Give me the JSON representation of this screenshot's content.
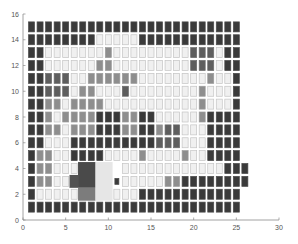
{
  "chart_data": {
    "type": "heatmap",
    "title": "",
    "xlabel": "",
    "ylabel": "",
    "xlim": [
      0,
      30
    ],
    "ylim": [
      0,
      16
    ],
    "xticks": [
      0,
      5,
      10,
      15,
      20,
      25,
      30
    ],
    "yticks": [
      0,
      2,
      4,
      6,
      8,
      10,
      12,
      14,
      16
    ],
    "grid": false,
    "legend": null,
    "n_cols": 25,
    "n_rows": 15,
    "cell_levels_legend": {
      "0": "light",
      "1": "medium gray",
      "2": "medium-dark",
      "3": "dark",
      "s": "small dark",
      "-": "merged region (no individual cell)"
    },
    "rows_top_to_bottom": [
      {
        "y": 15,
        "cells": "3333333333333333333333333"
      },
      {
        "y": 14,
        "cells": "3333333300000333333333333"
      },
      {
        "y": 13,
        "cells": "3300000001000000000222033"
      },
      {
        "y": 12,
        "cells": "3300000011000000000222033"
      },
      {
        "y": 11,
        "cells": "3322200111111000000001003"
      },
      {
        "y": 10,
        "cells": "3322201100020000000010003"
      },
      {
        "y": 9,
        "cells": "3311011110000000000010003"
      },
      {
        "y": 8,
        "cells": "3310111133311330000013333"
      },
      {
        "y": 7,
        "cells": "3311011133311331220003333"
      },
      {
        "y": 6,
        "cells": "3300033333333332220003333"
      },
      {
        "y": 5,
        "cells": "3110033330000100001003333"
      },
      {
        "y": 4,
        "cells": "3110000----000000000000333"
      },
      {
        "y": 3,
        "cells": "31100-----s000001133333333"
      },
      {
        "y": 2,
        "cells": "300000----000333333333333"
      },
      {
        "y": 1,
        "cells": "3333333333333333333333333"
      }
    ],
    "merged_regions": [
      {
        "name": "dark-block",
        "x0": 6.45,
        "x1": 8.5,
        "y0": 2.5,
        "y1": 4.5,
        "color": "#4a4a4a"
      },
      {
        "name": "dark-block-ext",
        "x0": 5.45,
        "x1": 6.45,
        "y0": 2.5,
        "y1": 3.5,
        "color": "#525252"
      },
      {
        "name": "medium-block",
        "x0": 6.45,
        "x1": 8.5,
        "y0": 1.5,
        "y1": 2.5,
        "color": "#7c7c7c"
      },
      {
        "name": "light-block",
        "x0": 8.5,
        "x1": 10.5,
        "y0": 1.5,
        "y1": 4.5,
        "color": "#e6e6e6"
      }
    ]
  },
  "colors": {
    "level_0_fill": "#f0f0f0",
    "level_0_stroke": "#c4c4c4",
    "level_1_fill": "#8e8e8e",
    "level_2_fill": "#5e5e5e",
    "level_3_fill": "#3a3a3a",
    "axis": "#8a8a8a",
    "tick_label": "#555555"
  }
}
